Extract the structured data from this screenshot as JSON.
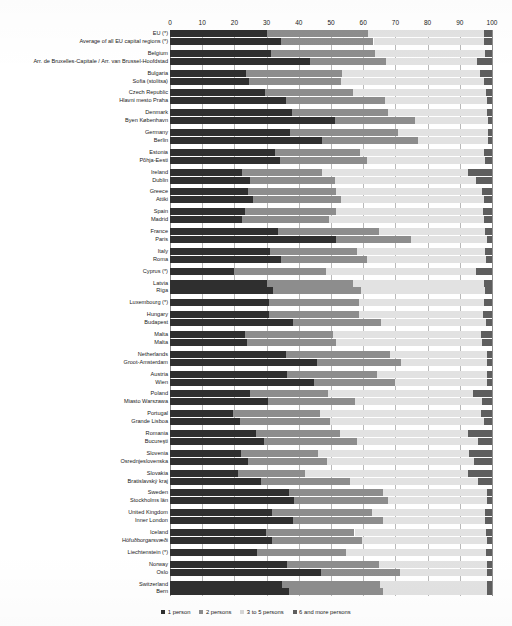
{
  "chart_data": {
    "type": "bar",
    "subtype": "stacked-horizontal-100pct",
    "title": "",
    "xlabel": "",
    "ylabel": "",
    "xlim": [
      0,
      100
    ],
    "xticks": [
      0,
      10,
      20,
      30,
      40,
      50,
      60,
      70,
      80,
      90,
      100
    ],
    "grid": true,
    "legend_position": "bottom-center",
    "series": [
      {
        "name": "1 person",
        "color": "#2f2f2f"
      },
      {
        "name": "2 persons",
        "color": "#8d8d8d"
      },
      {
        "name": "3 to 5 persons",
        "color": "#e2e2e2"
      },
      {
        "name": "6 and more persons",
        "color": "#5e5e5e"
      }
    ],
    "categories": [
      "EU (*)",
      "Average of all EU capital regions (*)",
      "Belgium",
      "Arr. de Bruxelles-Capitale / Arr. van Brussel-Hoofdstad",
      "Bulgaria",
      "Sofia (stolitsa)",
      "Czech Republic",
      "Hlavni mesto Praha",
      "Denmark",
      "Byen København",
      "Germany",
      "Berlin",
      "Estonia",
      "Põhja-Eesti",
      "Ireland",
      "Dublin",
      "Greece",
      "Attiki",
      "Spain",
      "Madrid",
      "France",
      "Paris",
      "Italy",
      "Roma",
      "Cyprus (*)",
      "Latvia",
      "Rīga",
      "Luxembourg (*)",
      "Hungary",
      "Budapest",
      "Malta",
      "Malta",
      "Netherlands",
      "Groot-Amsterdam",
      "Austria",
      "Wien",
      "Poland",
      "Miasto Warszawa",
      "Portugal",
      "Grande Lisboa",
      "Romania",
      "Bucureşti",
      "Slovenia",
      "Osrednjeslovenska",
      "Slovakia",
      "Bratislavský kraj",
      "Sweden",
      "Stockholms län",
      "United Kingdom",
      "Inner London",
      "Iceland",
      "Höfuðborgarsvæði",
      "Liechtenstein (*)",
      "Norway",
      "Oslo",
      "Switzerland",
      "Bern"
    ],
    "rows": [
      {
        "label": "EU (*)",
        "values": [
          30.2,
          31.3,
          36.0,
          2.5
        ],
        "group": 0
      },
      {
        "label": "Average of all EU capital regions (*)",
        "values": [
          34.6,
          28.6,
          34.3,
          2.5
        ],
        "group": 0
      },
      {
        "label": "Belgium",
        "values": [
          31.5,
          32.2,
          34.0,
          2.3
        ],
        "group": 1
      },
      {
        "label": "Arr. de Bruxelles-Capitale / Arr. van Brussel-Hoofdstad",
        "values": [
          43.5,
          23.6,
          28.1,
          4.8
        ],
        "group": 1
      },
      {
        "label": "Bulgaria",
        "values": [
          23.7,
          29.8,
          42.9,
          3.6
        ],
        "group": 2
      },
      {
        "label": "Sofia (stolitsa)",
        "values": [
          24.6,
          28.5,
          44.4,
          2.5
        ],
        "group": 2
      },
      {
        "label": "Czech Republic",
        "values": [
          29.4,
          27.5,
          41.1,
          2.0
        ],
        "group": 3
      },
      {
        "label": "Hlavni mesto Praha",
        "values": [
          36.0,
          30.9,
          31.4,
          1.7
        ],
        "group": 3
      },
      {
        "label": "Denmark",
        "values": [
          37.9,
          29.7,
          30.7,
          1.7
        ],
        "group": 4
      },
      {
        "label": "Byen København",
        "values": [
          51.1,
          24.9,
          22.8,
          1.2
        ],
        "group": 4
      },
      {
        "label": "Germany",
        "values": [
          37.2,
          33.6,
          28.0,
          1.2
        ],
        "group": 5
      },
      {
        "label": "Berlin",
        "values": [
          47.1,
          29.9,
          21.9,
          1.1
        ],
        "group": 5
      },
      {
        "label": "Estonia",
        "values": [
          32.6,
          26.4,
          38.4,
          2.6
        ],
        "group": 6
      },
      {
        "label": "Põhja-Eesti",
        "values": [
          34.2,
          27.1,
          36.4,
          2.3
        ],
        "group": 6
      },
      {
        "label": "Ireland",
        "values": [
          22.3,
          24.8,
          45.6,
          7.3
        ],
        "group": 7
      },
      {
        "label": "Dublin",
        "values": [
          24.9,
          26.4,
          43.7,
          5.0
        ],
        "group": 7
      },
      {
        "label": "Greece",
        "values": [
          24.2,
          27.3,
          45.5,
          3.0
        ],
        "group": 8
      },
      {
        "label": "Attiki",
        "values": [
          25.8,
          27.2,
          44.6,
          2.4
        ],
        "group": 8
      },
      {
        "label": "Spain",
        "values": [
          23.2,
          28.4,
          45.7,
          2.7
        ],
        "group": 9
      },
      {
        "label": "Madrid",
        "values": [
          22.5,
          26.8,
          48.1,
          2.6
        ],
        "group": 9
      },
      {
        "label": "France",
        "values": [
          33.5,
          31.4,
          32.9,
          2.2
        ],
        "group": 10
      },
      {
        "label": "Paris",
        "values": [
          51.4,
          23.3,
          23.7,
          1.6
        ],
        "group": 10
      },
      {
        "label": "Italy",
        "values": [
          31.0,
          27.1,
          39.7,
          2.2
        ],
        "group": 11
      },
      {
        "label": "Roma",
        "values": [
          34.5,
          26.7,
          36.9,
          1.9
        ],
        "group": 11
      },
      {
        "label": "Cyprus (*)",
        "values": [
          19.9,
          28.4,
          46.6,
          5.1
        ],
        "group": 12
      },
      {
        "label": "Latvia",
        "values": [
          30.2,
          26.6,
          40.6,
          2.6
        ],
        "group": 13
      },
      {
        "label": "Rīga",
        "values": [
          32.0,
          27.4,
          38.5,
          2.1
        ],
        "group": 13
      },
      {
        "label": "Luxembourg (*)",
        "values": [
          30.6,
          28.1,
          38.8,
          2.5
        ],
        "group": 14
      },
      {
        "label": "Hungary",
        "values": [
          30.7,
          28.0,
          38.5,
          2.8
        ],
        "group": 15
      },
      {
        "label": "Budapest",
        "values": [
          38.2,
          27.2,
          32.6,
          2.0
        ],
        "group": 15
      },
      {
        "label": "Malta",
        "values": [
          23.4,
          27.3,
          46.0,
          3.3
        ],
        "group": 16
      },
      {
        "label": "Malta",
        "values": [
          24.0,
          27.5,
          45.3,
          3.2
        ],
        "group": 16
      },
      {
        "label": "Netherlands",
        "values": [
          36.0,
          32.2,
          30.4,
          1.4
        ],
        "group": 17
      },
      {
        "label": "Groot-Amsterdam",
        "values": [
          45.5,
          26.1,
          26.9,
          1.5
        ],
        "group": 17
      },
      {
        "label": "Austria",
        "values": [
          36.3,
          27.9,
          34.1,
          1.7
        ],
        "group": 18
      },
      {
        "label": "Wien",
        "values": [
          44.7,
          25.3,
          28.4,
          1.6
        ],
        "group": 18
      },
      {
        "label": "Poland",
        "values": [
          24.8,
          24.3,
          44.9,
          6.0
        ],
        "group": 19
      },
      {
        "label": "Miasto Warszawa",
        "values": [
          30.5,
          27.0,
          39.5,
          3.0
        ],
        "group": 19
      },
      {
        "label": "Portugal",
        "values": [
          19.6,
          27.0,
          49.9,
          3.5
        ],
        "group": 20
      },
      {
        "label": "Grande Lisboa",
        "values": [
          21.8,
          28.0,
          47.6,
          2.6
        ],
        "group": 20
      },
      {
        "label": "Romania",
        "values": [
          26.7,
          26.0,
          40.0,
          7.3
        ],
        "group": 21
      },
      {
        "label": "Bucureşti",
        "values": [
          29.3,
          28.7,
          37.7,
          4.3
        ],
        "group": 21
      },
      {
        "label": "Slovenia",
        "values": [
          22.1,
          24.0,
          46.8,
          7.1
        ],
        "group": 22
      },
      {
        "label": "Osrednjeslovenska",
        "values": [
          24.1,
          24.8,
          45.4,
          5.7
        ],
        "group": 22
      },
      {
        "label": "Slovakia",
        "values": [
          21.0,
          20.9,
          50.6,
          7.5
        ],
        "group": 23
      },
      {
        "label": "Bratislavský kraj",
        "values": [
          28.3,
          27.5,
          39.9,
          4.3
        ],
        "group": 23
      },
      {
        "label": "Sweden",
        "values": [
          36.9,
          29.3,
          32.3,
          1.5
        ],
        "group": 24
      },
      {
        "label": "Stockholms län",
        "values": [
          38.6,
          29.0,
          30.8,
          1.6
        ],
        "group": 24
      },
      {
        "label": "United Kingdom",
        "values": [
          31.7,
          31.1,
          35.1,
          2.1
        ],
        "group": 25
      },
      {
        "label": "Inner London",
        "values": [
          38.3,
          28.0,
          31.5,
          2.2
        ],
        "group": 25
      },
      {
        "label": "Iceland",
        "values": [
          29.9,
          27.4,
          40.8,
          1.9
        ],
        "group": 26
      },
      {
        "label": "Höfuðborgarsvæði",
        "values": [
          31.7,
          28.0,
          38.6,
          1.7
        ],
        "group": 26
      },
      {
        "label": "Liechtenstein (*)",
        "values": [
          27.0,
          27.7,
          43.3,
          2.0
        ],
        "group": 27
      },
      {
        "label": "Norway",
        "values": [
          36.4,
          28.5,
          33.5,
          1.6
        ],
        "group": 28
      },
      {
        "label": "Oslo",
        "values": [
          47.0,
          24.3,
          27.1,
          1.6
        ],
        "group": 28
      },
      {
        "label": "Switzerland",
        "values": [
          34.8,
          30.3,
          33.3,
          1.6
        ],
        "group": 29
      },
      {
        "label": "Bern",
        "values": [
          36.9,
          29.3,
          32.2,
          1.6
        ],
        "group": 29
      }
    ]
  },
  "legend": {
    "items": [
      {
        "label": "1 person"
      },
      {
        "label": "2 persons"
      },
      {
        "label": "3 to 5 persons"
      },
      {
        "label": "6 and more persons"
      }
    ]
  }
}
